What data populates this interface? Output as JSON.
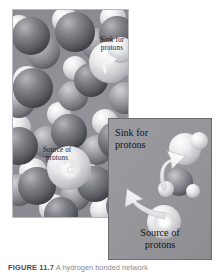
{
  "figure": {
    "main_image": {
      "name": "space-filling-water-molecule-model",
      "background_color": "#8e8e93",
      "oxygen_color": "#6e6e74",
      "hydrogen_color": "#e8e8ea",
      "labels": {
        "sink": "Sink for\nprotons",
        "sink_line1": "Sink for",
        "sink_line2": "protons",
        "source": "Source of\nprotons",
        "source_line1": "Source of",
        "source_line2": "protons"
      }
    },
    "inset": {
      "name": "proton-transfer-detail-inset",
      "background_color": "#96969b",
      "border_color": "#6d6d72",
      "arrow_color": "#f0f0f0",
      "labels": {
        "sink_line1": "Sink for",
        "sink_line2": "protons",
        "source_line1": "Source of",
        "source_line2": "protons"
      },
      "arrows": [
        {
          "name": "proton-to-sink-arrow",
          "direction": "up-right"
        },
        {
          "name": "proton-from-source-arrow",
          "direction": "up-left"
        }
      ]
    },
    "caption": {
      "number": "FIGURE 11.7",
      "text": "  A hydrogen bonded network",
      "truncated": true
    }
  }
}
